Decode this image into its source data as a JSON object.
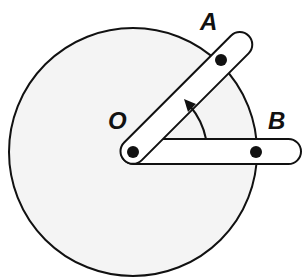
{
  "diagram": {
    "labels": {
      "origin": "O",
      "point_a": "A",
      "point_b": "B"
    },
    "colors": {
      "disk_fill": "#f4f4f4",
      "stroke": "#111111",
      "bar_fill": "#ffffff",
      "dot": "#111111"
    },
    "geometry": {
      "disk_center": [
        133,
        152
      ],
      "disk_radius": 124,
      "pivot": [
        133,
        152
      ],
      "bar_ob_angle_deg": 0,
      "bar_oa_angle_deg": 45,
      "angle_arrow": "counterclockwise from OB to OA"
    }
  }
}
